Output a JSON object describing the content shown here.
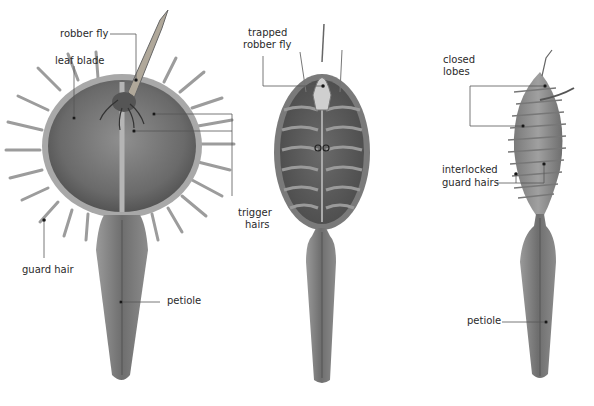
{
  "diagram": {
    "panels": [
      {
        "id": "open-trap",
        "labels": {
          "robber_fly": "robber fly",
          "leaf_blade": "leaf blade",
          "trigger_hairs_1": "trigger",
          "trigger_hairs_2": "hairs",
          "guard_hair": "guard hair",
          "petiole": "petiole"
        }
      },
      {
        "id": "closing-trap",
        "labels": {
          "trapped_1": "trapped",
          "trapped_2": "robber fly"
        }
      },
      {
        "id": "closed-trap",
        "labels": {
          "closed_1": "closed",
          "closed_2": "lobes",
          "interlocked_1": "interlocked",
          "interlocked_2": "guard hairs",
          "petiole": "petiole"
        }
      }
    ],
    "colors": {
      "leaf_dark": "#5a5a5a",
      "leaf_mid": "#8a8a8a",
      "leaf_light": "#b8b8b8",
      "leader_line": "#555555",
      "text": "#2a2a2a"
    }
  }
}
